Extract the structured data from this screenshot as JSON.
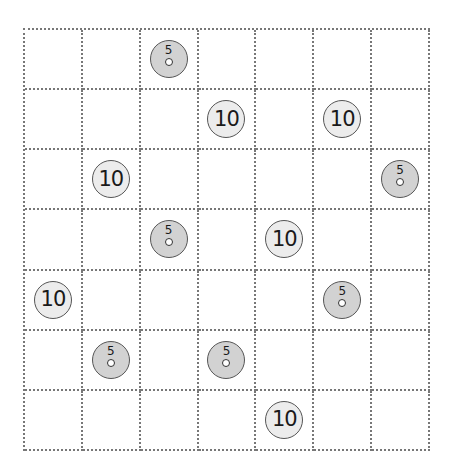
{
  "title": "",
  "grid": {
    "rows": 7,
    "cols": 7
  },
  "colors": {
    "coin5": "#d2d2d2",
    "coin10": "#ececec",
    "gridline": "#777777"
  },
  "coins": [
    {
      "row": 0,
      "col": 2,
      "value": "5"
    },
    {
      "row": 1,
      "col": 3,
      "value": "10"
    },
    {
      "row": 1,
      "col": 5,
      "value": "10"
    },
    {
      "row": 2,
      "col": 1,
      "value": "10"
    },
    {
      "row": 2,
      "col": 6,
      "value": "5"
    },
    {
      "row": 3,
      "col": 2,
      "value": "5"
    },
    {
      "row": 3,
      "col": 4,
      "value": "10"
    },
    {
      "row": 4,
      "col": 0,
      "value": "10"
    },
    {
      "row": 4,
      "col": 5,
      "value": "5"
    },
    {
      "row": 5,
      "col": 1,
      "value": "5"
    },
    {
      "row": 5,
      "col": 3,
      "value": "5"
    },
    {
      "row": 6,
      "col": 4,
      "value": "10"
    }
  ]
}
